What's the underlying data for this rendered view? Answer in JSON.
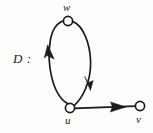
{
  "figure": {
    "name": "diagram-digraph-D",
    "caption_label": "D :",
    "background_color": "#fdfdfc",
    "ink_color": "#1b1b1b",
    "width": 153,
    "height": 133
  },
  "graph": {
    "type": "directed-multigraph",
    "vertex_count": 3,
    "arc_count": 3,
    "vertices": [
      {
        "id": "w",
        "label": "w",
        "cx": 68,
        "cy": 21,
        "r": 4.6,
        "fill": "#ffffff",
        "stroke": "#1b1b1b"
      },
      {
        "id": "u",
        "label": "u",
        "cx": 70,
        "cy": 108,
        "r": 4.6,
        "fill": "#ffffff",
        "stroke": "#1b1b1b"
      },
      {
        "id": "v",
        "label": "v",
        "cx": 140,
        "cy": 106,
        "r": 4.6,
        "fill": "#ffffff",
        "stroke": "#1b1b1b"
      }
    ],
    "arcs": [
      {
        "id": "arc-u-w",
        "from": "u",
        "to": "w",
        "shape": "curve-left",
        "arrowhead_at": [
          48,
          52
        ]
      },
      {
        "id": "arc-w-u",
        "from": "w",
        "to": "u",
        "shape": "curve-right",
        "arrowhead_at": [
          88,
          80
        ]
      },
      {
        "id": "arc-u-v",
        "from": "u",
        "to": "v",
        "shape": "straight",
        "arrowhead_at": [
          124,
          107
        ]
      }
    ]
  },
  "labels": {
    "diagram": "D :",
    "w": "w",
    "u": "u",
    "v": "v"
  }
}
